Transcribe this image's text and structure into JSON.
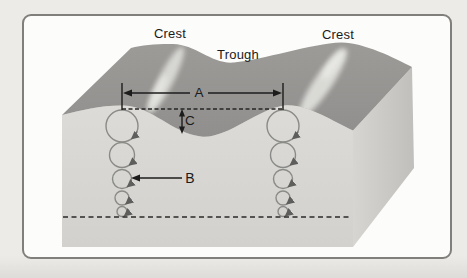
{
  "figure": {
    "title": "wave-motion-block-diagram",
    "labels": {
      "crest_left": "Crest",
      "trough": "Trough",
      "crest_right": "Crest",
      "dim_wavelength": "A",
      "dim_orbit": "B",
      "dim_wave_height": "C"
    },
    "colors": {
      "page_bg": "#ecebe8",
      "card_bg": "#fcfcfa",
      "card_border": "#807f7c",
      "water_surface_top": "#979694",
      "front_face": "#dad9d5",
      "side_face": "#c7c6c2",
      "foam": "#ebebe7",
      "annotation_line": "#1c1c1c",
      "orbit_stroke": "#8a8a88"
    }
  }
}
